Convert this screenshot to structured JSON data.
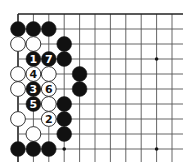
{
  "diagram": {
    "type": "go-board-corner",
    "colors": {
      "background": "#ffffff",
      "line": "#555555",
      "edge": "#222222",
      "black": "#111111",
      "white": "#ffffff",
      "stone_outline": "#222222"
    },
    "grid": {
      "origin_x": 18,
      "origin_y": 14,
      "dx": 15.4,
      "dy": 15,
      "cols": 11,
      "rows": 10,
      "extend_right": 183,
      "extend_bottom": 162,
      "edge_top": true,
      "edge_left": true
    },
    "star_points": [
      {
        "col": 9,
        "row": 3
      },
      {
        "col": 9,
        "row": 9
      },
      {
        "col": 3,
        "row": 9
      }
    ],
    "stones": [
      {
        "col": 0,
        "row": 1,
        "color": "black",
        "label": ""
      },
      {
        "col": 1,
        "row": 1,
        "color": "black",
        "label": ""
      },
      {
        "col": 2,
        "row": 1,
        "color": "black",
        "label": ""
      },
      {
        "col": 0,
        "row": 2,
        "color": "white",
        "label": ""
      },
      {
        "col": 1,
        "row": 2,
        "color": "white",
        "label": ""
      },
      {
        "col": 3,
        "row": 2,
        "color": "black",
        "label": ""
      },
      {
        "col": 1,
        "row": 3,
        "color": "black",
        "label": "1"
      },
      {
        "col": 2,
        "row": 3,
        "color": "black",
        "label": "7"
      },
      {
        "col": 3,
        "row": 3,
        "color": "black",
        "label": ""
      },
      {
        "col": 0,
        "row": 4,
        "color": "white",
        "label": ""
      },
      {
        "col": 1,
        "row": 4,
        "color": "white",
        "label": "4"
      },
      {
        "col": 2,
        "row": 4,
        "color": "white",
        "label": ""
      },
      {
        "col": 4,
        "row": 4,
        "color": "black",
        "label": ""
      },
      {
        "col": 0,
        "row": 5,
        "color": "white",
        "label": ""
      },
      {
        "col": 1,
        "row": 5,
        "color": "black",
        "label": "3"
      },
      {
        "col": 2,
        "row": 5,
        "color": "white",
        "label": "6"
      },
      {
        "col": 4,
        "row": 5,
        "color": "black",
        "label": ""
      },
      {
        "col": 1,
        "row": 6,
        "color": "black",
        "label": "5"
      },
      {
        "col": 2,
        "row": 6,
        "color": "white",
        "label": ""
      },
      {
        "col": 3,
        "row": 6,
        "color": "black",
        "label": ""
      },
      {
        "col": 0,
        "row": 7,
        "color": "white",
        "label": ""
      },
      {
        "col": 2,
        "row": 7,
        "color": "white",
        "label": "2"
      },
      {
        "col": 3,
        "row": 7,
        "color": "black",
        "label": ""
      },
      {
        "col": 1,
        "row": 8,
        "color": "white",
        "label": ""
      },
      {
        "col": 3,
        "row": 8,
        "color": "black",
        "label": ""
      },
      {
        "col": 0,
        "row": 9,
        "color": "black",
        "label": ""
      },
      {
        "col": 1,
        "row": 9,
        "color": "black",
        "label": ""
      },
      {
        "col": 2,
        "row": 9,
        "color": "black",
        "label": ""
      }
    ]
  }
}
